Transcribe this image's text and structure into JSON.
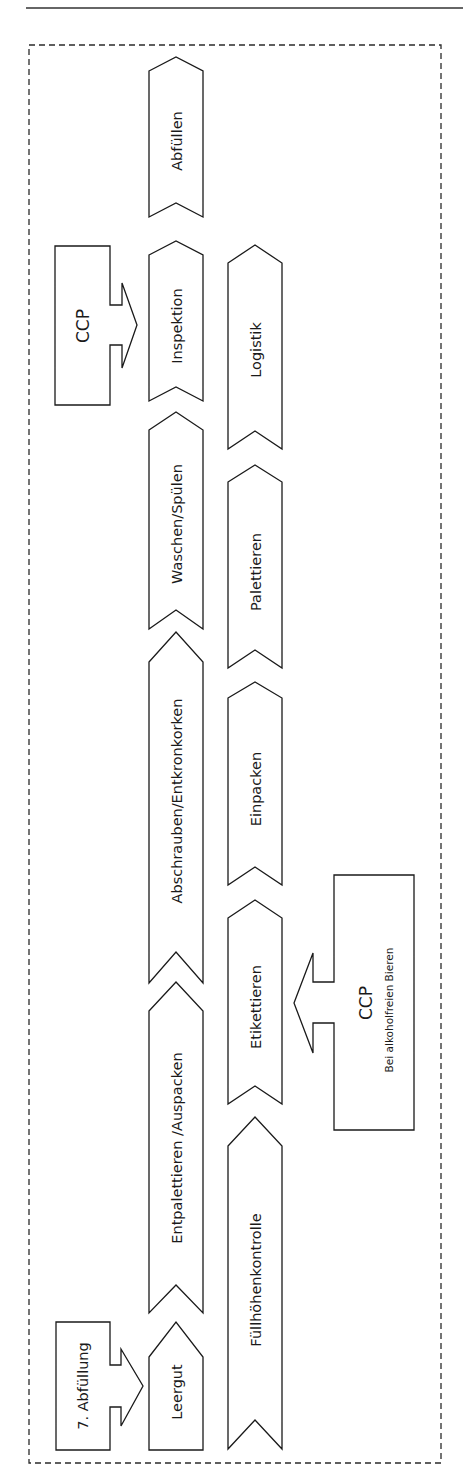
{
  "diagram": {
    "section_title": "7. Abfüllung",
    "column1_steps": [
      {
        "label": "Leergut"
      },
      {
        "label": "Entpalettieren /Auspacken"
      },
      {
        "label": "Abschrauben/Entkronkorken"
      },
      {
        "label": "Waschen/Spülen"
      },
      {
        "label": "Inspektion"
      },
      {
        "label": "Abfüllen"
      }
    ],
    "column2_steps": [
      {
        "label": "Füllhöhenkontrolle"
      },
      {
        "label": "Etikettieren"
      },
      {
        "label": "Einpacken"
      },
      {
        "label": "Palettieren"
      },
      {
        "label": "Logistik"
      }
    ],
    "ccp_callouts": [
      {
        "title": "CCP",
        "note": "",
        "target": "Inspektion"
      },
      {
        "title": "CCP",
        "note": "Bei alkoholfreien Bieren",
        "target": "Etikettieren"
      }
    ],
    "colors": {
      "stroke": "#1a1a1a",
      "fill": "#ffffff",
      "frame": "#2a2a2a"
    }
  }
}
